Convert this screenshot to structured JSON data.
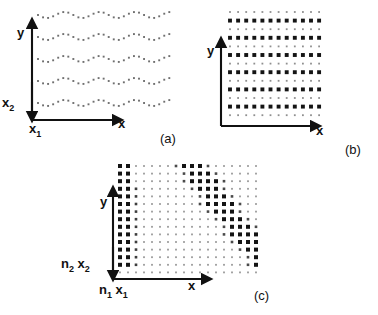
{
  "figure": {
    "type": "scientific-diagram",
    "background": "#ffffff",
    "ink_color": "#111111",
    "dot_dark": "#1a1a1a",
    "dot_light": "#8c8c8c"
  },
  "panels": [
    {
      "tag": "(a)",
      "tag_pos": {
        "x": 160,
        "y": 131
      },
      "origin": {
        "x": 32,
        "y": 120
      },
      "axis_x_len": 88,
      "axis_y_len": 95,
      "labels": {
        "x": "x",
        "y": "y",
        "x1": "x",
        "x1_sub": "1",
        "x2": "x",
        "x2_sub": "2"
      },
      "label_pos": {
        "x": {
          "x": 118,
          "y": 123
        },
        "y": {
          "x": 17,
          "y": 30
        },
        "x1": {
          "x": 30,
          "y": 126
        },
        "x2": {
          "x": 2,
          "y": 101
        }
      }
    },
    {
      "tag": "(b)",
      "tag_pos": {
        "x": 345,
        "y": 142
      },
      "origin": {
        "x": 221,
        "y": 126
      },
      "axis_x_len": 97,
      "axis_y_len": 77,
      "labels": {
        "x": "x",
        "y": "y"
      },
      "label_pos": {
        "x": {
          "x": 297,
          "y": 130
        },
        "y": {
          "x": 208,
          "y": 48
        }
      }
    },
    {
      "tag": "(c)",
      "tag_pos": {
        "x": 254,
        "y": 288
      },
      "origin": {
        "x": 113,
        "y": 279
      },
      "axis_x_len": 97,
      "axis_y_len": 100,
      "labels": {
        "x": "x",
        "y": "y",
        "n1x1_n": "n",
        "n1x1_nsub": "1",
        "n1x1_x": "x",
        "n1x1_xsub": "1",
        "n2x2_n": "n",
        "n2x2_nsub": "2",
        "n2x2_x": "x",
        "n2x2_xsub": "2"
      },
      "label_pos": {
        "x": {
          "x": 188,
          "y": 283
        },
        "y": {
          "x": 100,
          "y": 199
        },
        "n1x1": {
          "x": 99,
          "y": 285
        },
        "n2x2": {
          "x": 61,
          "y": 261
        }
      }
    }
  ],
  "chart_data": {
    "type": "scatter",
    "title": "",
    "panel_a": {
      "label": "(a)",
      "grid_type": "wavy-rows",
      "n_rows": 5,
      "n_cols": 27,
      "x_start": 38,
      "x_step": 5.05,
      "row_y": [
        15,
        37,
        59,
        81,
        103
      ],
      "wave_amplitude": 3.0,
      "wave_period_cols": 7,
      "dot_size": 1.9,
      "dot_color": "#6f6f6f"
    },
    "panel_b": {
      "label": "(b)",
      "grid_type": "alternating-rows",
      "n_rows": 13,
      "n_cols": 12,
      "x_start": 230,
      "x_step": 8.1,
      "y_start": 12,
      "y_step": 8.6,
      "big_rows": [
        1,
        3,
        5,
        7,
        9,
        11
      ],
      "big_size": 3.9,
      "small_size": 1.8,
      "big_color": "#141414",
      "small_color": "#8f8f8f"
    },
    "panel_c": {
      "label": "(c)",
      "grid_type": "dense-grid-with-diagonal-band",
      "n_rows": 15,
      "n_cols": 18,
      "x_start": 120,
      "x_step": 8.0,
      "y_start": 166,
      "y_step": 7.6,
      "left_dark_cols": [
        0,
        1
      ],
      "band_start_col_top": 9,
      "band_width": 3,
      "band_slope_cols_per_row": 0.18,
      "big_size": 4.0,
      "mid_size": 2.6,
      "small_size": 1.8,
      "big_color": "#141414",
      "small_color": "#9a9a9a"
    }
  }
}
